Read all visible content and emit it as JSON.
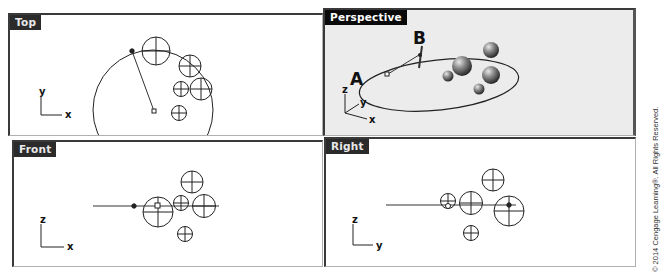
{
  "viewports": {
    "top": {
      "label": "Top",
      "axes": {
        "vertical": "y",
        "horizontal": "x"
      }
    },
    "perspective": {
      "label": "Perspective",
      "active": true,
      "axes": {
        "vertical": "z",
        "depth": "y",
        "horizontal": "x"
      },
      "point_labels": {
        "a": "A",
        "b": "B"
      }
    },
    "front": {
      "label": "Front",
      "axes": {
        "vertical": "z",
        "horizontal": "x"
      }
    },
    "right": {
      "label": "Right",
      "axes": {
        "vertical": "z",
        "horizontal": "y"
      }
    }
  },
  "copyright": "© 2014 Cengage Learning®. All Rights Reserved.",
  "colors": {
    "label_bg": "#2b2b2b",
    "active_label_bg": "#0a0a0a",
    "viewport_bg": "#ffffff",
    "active_viewport_bg": "#ececec",
    "line": "#222222"
  }
}
